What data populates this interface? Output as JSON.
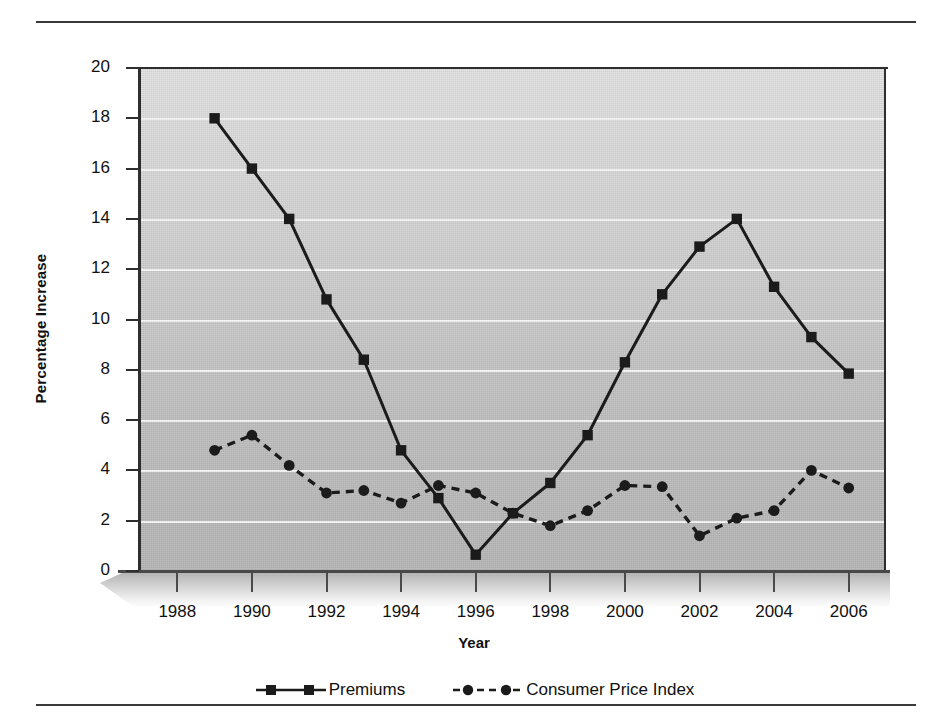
{
  "chart_data": {
    "type": "line",
    "title": "",
    "xlabel": "Year",
    "ylabel": "Percentage Increase",
    "xlim": [
      1987,
      2007
    ],
    "ylim": [
      0,
      20
    ],
    "ytick_step": 2,
    "grid": true,
    "legend_position": "bottom",
    "x": [
      1989,
      1990,
      1991,
      1992,
      1993,
      1994,
      1995,
      1996,
      1997,
      1998,
      1999,
      2000,
      2001,
      2002,
      2003,
      2004,
      2005,
      2006
    ],
    "xticks": [
      "1988",
      "1990",
      "1992",
      "1994",
      "1996",
      "1998",
      "2000",
      "2002",
      "2004",
      "2006"
    ],
    "yticks": [
      "0",
      "2",
      "4",
      "6",
      "8",
      "10",
      "12",
      "14",
      "16",
      "18",
      "20"
    ],
    "series": [
      {
        "name": "Premiums",
        "marker": "square",
        "linestyle": "solid",
        "color": "#1b1b1b",
        "values": [
          18.0,
          16.0,
          14.0,
          10.8,
          8.4,
          4.8,
          2.9,
          0.65,
          2.3,
          3.5,
          5.4,
          8.3,
          11.0,
          12.9,
          14.0,
          11.3,
          9.3,
          7.85
        ]
      },
      {
        "name": "Consumer Price Index",
        "marker": "circle",
        "linestyle": "dashed",
        "color": "#1b1b1b",
        "values": [
          4.8,
          5.4,
          4.2,
          3.1,
          3.2,
          2.7,
          3.4,
          3.1,
          2.3,
          1.8,
          2.4,
          3.4,
          3.35,
          1.4,
          2.1,
          2.4,
          4.0,
          3.3
        ]
      }
    ]
  },
  "legend": {
    "items": [
      {
        "label": "Premiums",
        "key": "solid-square-line-key"
      },
      {
        "label": "Consumer Price Index",
        "key": "dashed-circle-line-key"
      }
    ]
  },
  "axis": {
    "x_title": "Year",
    "y_title": "Percentage Increase"
  },
  "colors": {
    "ink": "#1b1b1b",
    "gridline": "#f7f7f7",
    "plot_background_top": "#e2e2e2",
    "plot_background_bottom": "#b6b6b6",
    "rule": "#3a3a3a"
  }
}
